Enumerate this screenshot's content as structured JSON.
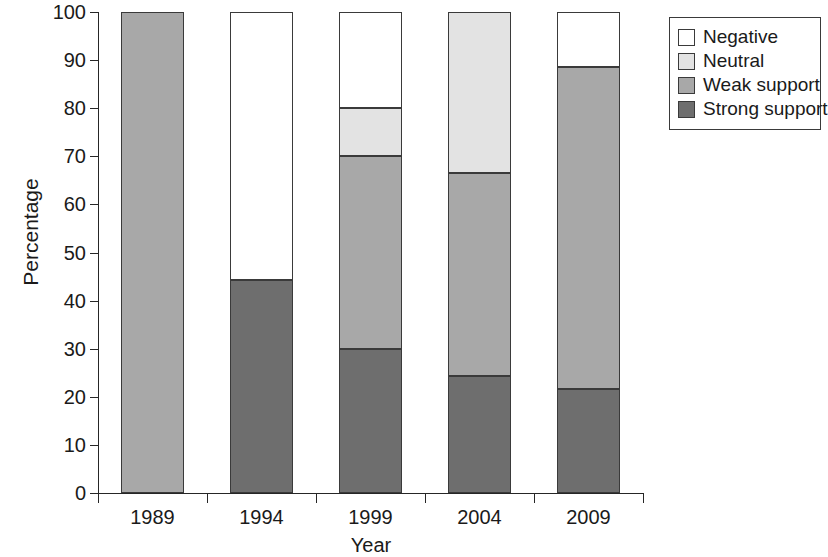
{
  "chart_data": {
    "type": "bar",
    "subtype": "stacked-bar-100",
    "title": "",
    "xlabel": "Year",
    "ylabel": "Percentage",
    "categories": [
      "1989",
      "1994",
      "1999",
      "2004",
      "2009"
    ],
    "xtick_labels": [
      "1989",
      "1994",
      "1999",
      "2004",
      "2009"
    ],
    "ytick_labels": [
      "0",
      "10",
      "20",
      "30",
      "40",
      "50",
      "60",
      "70",
      "80",
      "90",
      "100"
    ],
    "ytick_values": [
      0,
      10,
      20,
      30,
      40,
      50,
      60,
      70,
      80,
      90,
      100
    ],
    "ylim": [
      0,
      100
    ],
    "grid": false,
    "legend_position": "right-outside",
    "legend_entries": [
      "Negative",
      "Neutral",
      "Weak support",
      "Strong support"
    ],
    "stack_order_bottom_to_top": [
      "Strong support",
      "Weak support",
      "Neutral",
      "Negative"
    ],
    "series": [
      {
        "name": "Strong support",
        "color": "#6e6e6e",
        "values": [
          0,
          44.2,
          30.0,
          24.4,
          21.6
        ]
      },
      {
        "name": "Weak support",
        "color": "#a8a8a8",
        "values": [
          100,
          0,
          40.0,
          42.1,
          66.9
        ]
      },
      {
        "name": "Neutral",
        "color": "#e3e3e3",
        "values": [
          0,
          0,
          10.0,
          33.5,
          0
        ]
      },
      {
        "name": "Negative",
        "color": "#ffffff",
        "values": [
          0,
          55.8,
          20.0,
          0,
          11.5
        ]
      }
    ],
    "cumulative_tops": {
      "1989": {
        "Strong support": 0,
        "Weak support": 100,
        "Neutral": 100,
        "Negative": 100
      },
      "1994": {
        "Strong support": 44.2,
        "Weak support": 44.2,
        "Neutral": 44.2,
        "Negative": 100
      },
      "1999": {
        "Strong support": 30.0,
        "Weak support": 70.0,
        "Neutral": 80.0,
        "Negative": 100
      },
      "2004": {
        "Strong support": 24.4,
        "Weak support": 66.5,
        "Neutral": 100,
        "Negative": 100
      },
      "2009": {
        "Strong support": 21.6,
        "Weak support": 88.5,
        "Neutral": 88.5,
        "Negative": 100
      }
    }
  },
  "axes": {
    "y_title": "Percentage",
    "x_title": "Year"
  },
  "legend": {
    "items": [
      {
        "label": "Negative",
        "color": "#ffffff"
      },
      {
        "label": "Neutral",
        "color": "#e3e3e3"
      },
      {
        "label": "Weak support",
        "color": "#a8a8a8"
      },
      {
        "label": "Strong support",
        "color": "#6e6e6e"
      }
    ]
  },
  "colors": {
    "negative": "#ffffff",
    "neutral": "#e3e3e3",
    "weak_support": "#a8a8a8",
    "strong_support": "#6e6e6e",
    "axis": "#262626",
    "outline": "#3a3a3a",
    "background": "#ffffff"
  }
}
